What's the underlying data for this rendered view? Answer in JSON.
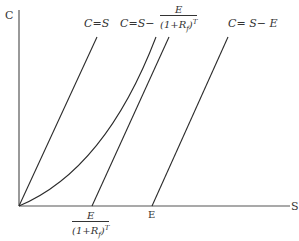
{
  "diagram": {
    "axes": {
      "y_label": "C",
      "x_label": "S"
    },
    "curves": [
      {
        "id": "upper-bound",
        "label_lhs": "C=",
        "label_rhs": "S",
        "type": "line"
      },
      {
        "id": "option-value",
        "type": "curve"
      },
      {
        "id": "lower-bound-pv",
        "label_lhs": "C=",
        "label_mid": "S−",
        "frac_num": "E",
        "frac_den_open": "(1+R",
        "frac_den_sub": "f",
        "frac_den_close": ")",
        "frac_den_sup": "T",
        "type": "line"
      },
      {
        "id": "lower-bound-intrinsic",
        "label": "C= S− E",
        "type": "line"
      }
    ],
    "x_ticks": {
      "pv_strike": {
        "num": "E",
        "den_open": "(1+R",
        "den_sub": "f",
        "den_close": ")",
        "den_sup": "T"
      },
      "strike": "E"
    },
    "colors": {
      "line": "#2b2b2b",
      "text": "#333333"
    }
  }
}
